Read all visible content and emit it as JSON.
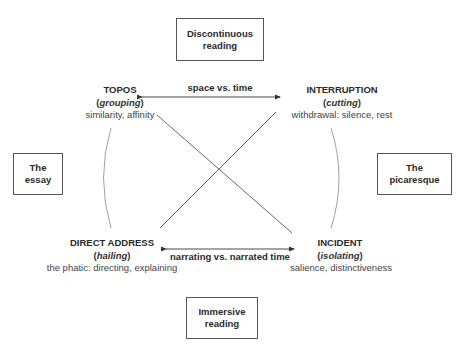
{
  "boxes": {
    "top": {
      "line1": "Discontinuous",
      "line2": "reading"
    },
    "bottom": {
      "line1": "Immersive",
      "line2": "reading"
    },
    "left": {
      "line1": "The",
      "line2": "essay"
    },
    "right": {
      "line1": "The",
      "line2": "picaresque"
    }
  },
  "nodes": {
    "topos": {
      "title": "TOPOS",
      "subtitle": "grouping",
      "description": "similarity, affinity"
    },
    "interruption": {
      "title": "INTERRUPTION",
      "subtitle": "cutting",
      "description": "withdrawal: silence, rest"
    },
    "direct_address": {
      "title": "DIRECT ADDRESS",
      "subtitle": "hailing",
      "description": "the phatic: directing, explaining"
    },
    "incident": {
      "title": "INCIDENT",
      "subtitle": "isolating",
      "description": "salience, distinctiveness"
    }
  },
  "axes": {
    "top": "space vs. time",
    "bottom": "narrating vs. narrated time"
  },
  "colors": {
    "line": "#555555",
    "arc": "#888888",
    "text": "#2a2a2a"
  }
}
